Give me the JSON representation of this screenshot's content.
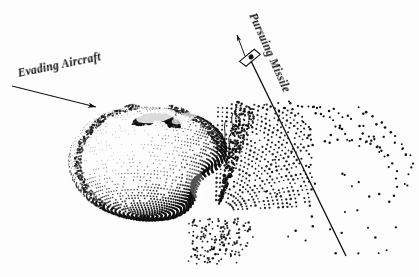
{
  "figure": {
    "background_color": "#fdfdfd",
    "ink_color": "#101010",
    "width": 419,
    "height": 277,
    "labels": {
      "evading_aircraft": "Evading Aircraft",
      "pursuing_missile": "Pursuing Missile"
    },
    "annotations": {
      "aircraft_leader_line": {
        "name": "leader-line-evading-aircraft",
        "x1": 12,
        "y1": 86,
        "x2": 96,
        "y2": 107,
        "arrowhead": "down-right"
      },
      "missile_trajectory_line": {
        "name": "missile-trajectory-line",
        "x1": 251,
        "y1": 61,
        "x2": 346,
        "y2": 256
      },
      "missile_heading_arrow": {
        "name": "missile-heading-arrow",
        "x1": 245,
        "y1": 56,
        "x2": 237,
        "y2": 35,
        "arrowhead": "up-left"
      },
      "missile_marker": {
        "name": "missile-marker",
        "cx": 250,
        "cy": 58,
        "shape": "elongated-quadrilateral-with-dot"
      }
    },
    "chart_data": {
      "type": "scatter",
      "title": "Evading Aircraft Reachable Set and Pursuing Missile Trajectory",
      "xlabel": "",
      "ylabel": "",
      "grid": false,
      "legend": "none",
      "xlim": [
        0,
        419
      ],
      "ylim": [
        0,
        277
      ],
      "series": [
        {
          "name": "evading-aircraft-reachable-set",
          "description": "Dense stippled deformed sphere (teardrop/apple shape with concave dimple at top) rendered as rows of dots along latitude and longitude curves",
          "marker": "dot",
          "style": "dense-stipple",
          "center": [
            150,
            162
          ],
          "radius_x": 74,
          "radius_y": 58,
          "bounds": [
            78,
            103,
            225,
            220
          ],
          "point_count": 2600
        },
        {
          "name": "cusp-plume",
          "description": "Fan of dots emanating from the cusp notch on the lower-right of the sphere, spreading up and to the right",
          "marker": "dot",
          "style": "medium-stipple",
          "apex": [
            218,
            210
          ],
          "bounds": [
            196,
            108,
            300,
            262
          ],
          "point_count": 430
        },
        {
          "name": "scattered-outer-points",
          "description": "Sparse scattered dots forming arc fragments to the right of the plume, crossed by the missile trajectory line",
          "marker": "dot",
          "style": "sparse-scatter",
          "bounds": [
            262,
            106,
            412,
            250
          ],
          "point_count": 120
        }
      ]
    }
  }
}
